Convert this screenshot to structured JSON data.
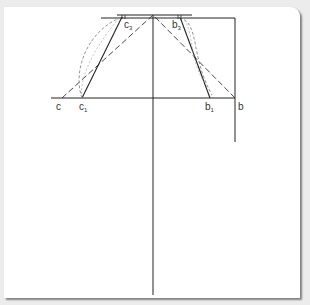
{
  "diagram": {
    "type": "geometric-construction",
    "colors": {
      "line": "#222222",
      "dashed": "#333333",
      "curve": "#8a8a8a",
      "background": "#ffffff",
      "page": "#ececec"
    },
    "labels": {
      "c": {
        "base": "c",
        "sub": ""
      },
      "c1": {
        "base": "c",
        "sub": "1"
      },
      "c3": {
        "base": "c",
        "sub": "3"
      },
      "b": {
        "base": "b",
        "sub": ""
      },
      "b1": {
        "base": "b",
        "sub": "1"
      },
      "b3": {
        "base": "b",
        "sub": "3"
      }
    },
    "points": {
      "apex": [
        153,
        15
      ],
      "c": [
        62,
        98
      ],
      "c1": [
        82,
        98
      ],
      "c3": [
        122,
        17
      ],
      "b": [
        235,
        98
      ],
      "b1": [
        210,
        98
      ],
      "b3": [
        180,
        17
      ]
    }
  }
}
